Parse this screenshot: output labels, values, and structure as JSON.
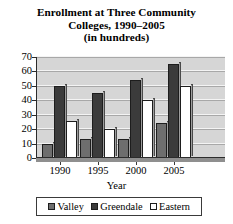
{
  "chart_data": {
    "type": "bar",
    "title": "Enrollment at Three Community Colleges, 1990–2005 (in hundreds)",
    "title_lines": [
      "Enrollment at Three Community",
      "Colleges, 1990–2005",
      "(in hundreds)"
    ],
    "xlabel": "Year",
    "ylabel": "",
    "categories": [
      "1990",
      "1995",
      "2000",
      "2005"
    ],
    "series": [
      {
        "name": "Valley",
        "values": [
          10,
          13,
          13,
          24
        ],
        "color": "#6e6e6e"
      },
      {
        "name": "Greendale",
        "values": [
          50,
          45,
          54,
          65
        ],
        "color": "#3b3b3b"
      },
      {
        "name": "Eastern",
        "values": [
          26,
          20,
          40,
          50
        ],
        "color": "#ffffff"
      }
    ],
    "ylim": [
      0,
      70
    ],
    "ytick_values": [
      0,
      10,
      20,
      30,
      40,
      50,
      60,
      70
    ],
    "ytick_labels": [
      "0",
      "10",
      "20",
      "30",
      "40",
      "50",
      "60",
      "70"
    ],
    "grid": true,
    "legend_position": "bottom",
    "plot_background": "#d6d6d6",
    "gridline_color": "#f4f4f4",
    "axis_color": "#2b2b2b"
  }
}
